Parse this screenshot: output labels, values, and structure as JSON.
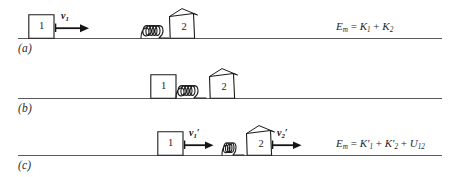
{
  "figure": {
    "background": "#ffffff",
    "line_color": "#5a5a5a",
    "ink_color": "#1b1b1b",
    "width": 459,
    "height": 177
  },
  "panels": [
    {
      "id": "a",
      "label": "(a)",
      "ground_y": 38,
      "ground_x": 18,
      "ground_width": 424,
      "block1": {
        "number": "1",
        "x": 28,
        "y": 14,
        "width": 26,
        "height": 24
      },
      "block2": {
        "number": "2",
        "x": 168,
        "y": 11,
        "width": 26,
        "height": 27
      },
      "spring": {
        "x": 140,
        "y": 20,
        "width": 30,
        "height": 18,
        "coils": 4,
        "state": "relaxed"
      },
      "velocities": [
        {
          "name": "v1",
          "label": "v",
          "sub": "1",
          "prime": "",
          "x": 57,
          "y": 27,
          "length": 30
        }
      ],
      "equation": {
        "x": 336,
        "y": 21,
        "lhs": "E",
        "lhs_sub": "m",
        "text": "E_m = K_1 + K_2",
        "terms": [
          {
            "sym": "K",
            "sub": "1",
            "prime": ""
          },
          {
            "sym": "K",
            "sub": "2",
            "prime": ""
          }
        ]
      }
    },
    {
      "id": "b",
      "label": "(b)",
      "ground_y": 98,
      "ground_x": 18,
      "ground_width": 424,
      "block1": {
        "number": "1",
        "x": 150,
        "y": 74,
        "width": 26,
        "height": 24
      },
      "block2": {
        "number": "2",
        "x": 208,
        "y": 71,
        "width": 26,
        "height": 27
      },
      "spring": {
        "x": 176,
        "y": 80,
        "width": 32,
        "height": 18,
        "coils": 4,
        "state": "compressed"
      },
      "velocities": [],
      "equation": null
    },
    {
      "id": "c",
      "label": "(c)",
      "ground_y": 155,
      "ground_x": 18,
      "ground_width": 424,
      "block1": {
        "number": "1",
        "x": 157,
        "y": 131,
        "width": 26,
        "height": 24
      },
      "block2": {
        "number": "2",
        "x": 245,
        "y": 128,
        "width": 26,
        "height": 27
      },
      "spring": {
        "x": 222,
        "y": 137,
        "width": 23,
        "height": 18,
        "coils": 4,
        "state": "compressed"
      },
      "velocities": [
        {
          "name": "v1-prime",
          "label": "v",
          "sub": "1",
          "prime": "′",
          "x": 186,
          "y": 144,
          "length": 27
        },
        {
          "name": "v2-prime",
          "label": "v",
          "sub": "2",
          "prime": "′",
          "x": 274,
          "y": 144,
          "length": 27
        }
      ],
      "equation": {
        "x": 336,
        "y": 138,
        "lhs": "E",
        "lhs_sub": "m",
        "text": "E_m = K'_1 + K'_2 + U_12",
        "terms": [
          {
            "sym": "K",
            "sub": "1",
            "prime": "′"
          },
          {
            "sym": "K",
            "sub": "2",
            "prime": "′"
          },
          {
            "sym": "U",
            "sub": "12",
            "prime": ""
          }
        ]
      }
    }
  ]
}
